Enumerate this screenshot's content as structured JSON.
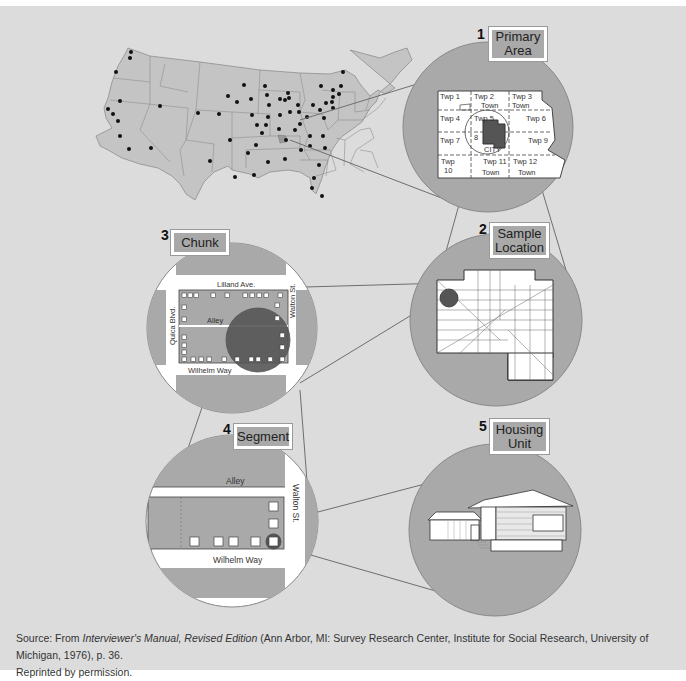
{
  "steps": [
    {
      "number": "1",
      "label_line1": "Primary",
      "label_line2": "Area"
    },
    {
      "number": "2",
      "label_line1": "Sample",
      "label_line2": "Location"
    },
    {
      "number": "3",
      "label_line1": "Chunk",
      "label_line2": ""
    },
    {
      "number": "4",
      "label_line1": "Segment",
      "label_line2": ""
    },
    {
      "number": "5",
      "label_line1": "Housing",
      "label_line2": "Unit"
    }
  ],
  "primary_area": {
    "townships": [
      "Twp 1",
      "Twp 2",
      "Town",
      "Twp 3",
      "Town",
      "Twp 4",
      "Twp 5",
      "Twp 6",
      "Twp 7",
      "8",
      "CITY",
      "Twp 9",
      "Twp",
      "10",
      "Twp 11",
      "Town",
      "Twp 12",
      "Town"
    ]
  },
  "chunk": {
    "streets": {
      "top": "Lilland Ave.",
      "middle": "Alley",
      "bottom": "Wilhelm Way",
      "left": "Quica Blvd.",
      "right": "Walton St."
    }
  },
  "segment": {
    "streets": {
      "top": "Alley",
      "bottom": "Wilhelm Way",
      "right": "Walton St."
    }
  },
  "source": {
    "prefix": "Source: From ",
    "title": "Interviewer's Manual, Revised Edition",
    "suffix": " (Ann Arbor, MI: Survey Research Center, Institute for Social Research, University of Michigan, 1976), p. 36.",
    "line2": "Reprinted by permission."
  },
  "colors": {
    "background": "#dcdcdc",
    "circle": "#a9a9a9",
    "map": "#c4c4c4",
    "dark": "#555555"
  }
}
